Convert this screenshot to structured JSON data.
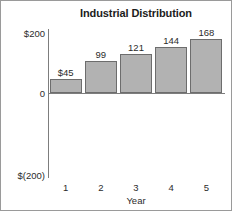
{
  "chart_data": {
    "type": "bar",
    "title": "Industrial Distribution",
    "xlabel": "Year",
    "ylabel": "Profit per customer",
    "categories": [
      "1",
      "2",
      "3",
      "4",
      "5"
    ],
    "values": [
      45,
      99,
      121,
      144,
      168
    ],
    "data_labels": [
      "$45",
      "99",
      "121",
      "144",
      "168"
    ],
    "ylim": [
      -200,
      200
    ],
    "ytick_labels": [
      "$200",
      "0",
      "$(200)"
    ],
    "ytick_values": [
      200,
      0,
      -200
    ],
    "grid": false,
    "legend": false,
    "bar_fill_color": "#b2b2b2",
    "bar_border_color": "#6d6d6d",
    "axis_color": "#7d7d7d",
    "text_color": "#2b2b2b",
    "background_color": "#ffffff",
    "frame_border_color": "#9a9a9a"
  }
}
